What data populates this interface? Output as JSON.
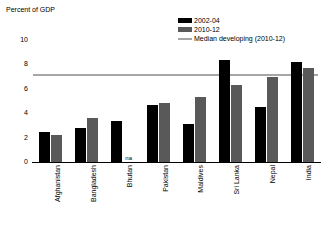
{
  "chart_data": {
    "type": "bar",
    "title": "",
    "ylabel": "Percent of GDP",
    "xlabel": "",
    "ylim": [
      0,
      10
    ],
    "yticks": [
      0,
      2,
      4,
      6,
      8,
      10
    ],
    "grid": false,
    "legend_position": "top-right",
    "categories": [
      "Afghanistan",
      "Bangladesh",
      "Bhutan",
      "Pakistan",
      "Maldives",
      "Sri Lanka",
      "Nepal",
      "India"
    ],
    "series": [
      {
        "name": "2002-04",
        "color": "#000000",
        "values": [
          2.5,
          2.8,
          3.4,
          4.7,
          3.1,
          8.4,
          4.5,
          8.2
        ]
      },
      {
        "name": "2010-12",
        "color": "#595959",
        "values": [
          2.2,
          3.6,
          null,
          4.8,
          5.3,
          6.3,
          7.0,
          7.7
        ]
      }
    ],
    "reference_line": {
      "name": "Median developing (2010-12)",
      "value": 7.2,
      "color": "#a6a6a6"
    },
    "annotations": [
      {
        "text": "na",
        "category": "Bhutan",
        "series": "2010-12"
      }
    ]
  },
  "legend": {
    "items": [
      {
        "label": "2002-04",
        "marker": "square-black-swatch"
      },
      {
        "label": "2010-12",
        "marker": "square-gray-swatch"
      },
      {
        "label": "Median developing (2010-12)",
        "marker": "line-gray-swatch"
      }
    ]
  }
}
